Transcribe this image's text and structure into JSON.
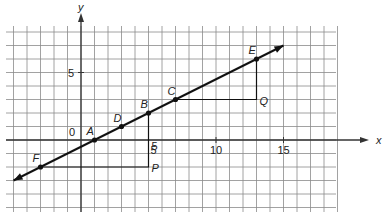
{
  "diagram": {
    "type": "coordinate-grid-line",
    "axes": {
      "x_label": "x",
      "y_label": "y",
      "origin_label": "0",
      "x_ticks": [
        {
          "value": 5,
          "label": "5"
        },
        {
          "value": 10,
          "label": "10"
        },
        {
          "value": 15,
          "label": "15"
        }
      ],
      "y_ticks": [
        {
          "value": 5,
          "label": "5"
        }
      ]
    },
    "line": {
      "from": [
        -5,
        -3
      ],
      "to": [
        15,
        7
      ],
      "slope": 0.5,
      "arrows": "both"
    },
    "points": [
      {
        "name": "F",
        "x": -3,
        "y": -2
      },
      {
        "name": "A",
        "x": 1,
        "y": 0
      },
      {
        "name": "D",
        "x": 3,
        "y": 1
      },
      {
        "name": "B",
        "x": 5,
        "y": 2
      },
      {
        "name": "C",
        "x": 7,
        "y": 3
      },
      {
        "name": "E",
        "x": 13,
        "y": 6
      }
    ],
    "corner_points": [
      {
        "name": "P",
        "x": 5,
        "y": -2
      },
      {
        "name": "Q",
        "x": 13,
        "y": 3
      }
    ],
    "triangles": [
      {
        "vertices": [
          "F",
          "P",
          "B"
        ],
        "rise_label": "5"
      },
      {
        "vertices": [
          "C",
          "Q",
          "E"
        ]
      }
    ],
    "colors": {
      "grid": "#8a8a8a",
      "axis": "#333333",
      "line": "#111111"
    }
  }
}
